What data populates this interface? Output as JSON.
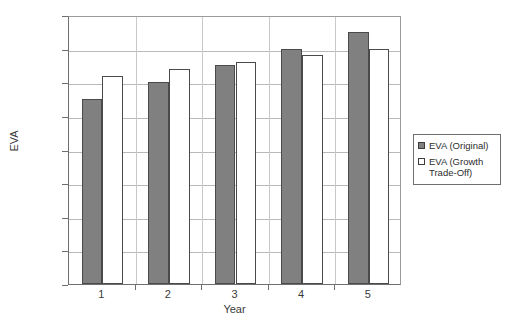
{
  "chart_data": {
    "type": "bar",
    "title": "",
    "xlabel": "Year",
    "ylabel": "EVA",
    "categories": [
      "1",
      "2",
      "3",
      "4",
      "5"
    ],
    "series": [
      {
        "name": "EVA (Original)",
        "values": [
          5.5,
          6.0,
          6.5,
          7.0,
          7.5
        ],
        "color": "#808080"
      },
      {
        "name": "EVA (Growth Trade-Off)",
        "values": [
          6.2,
          6.4,
          6.6,
          6.8,
          7.0
        ],
        "color": "#ffffff"
      }
    ],
    "ylim": [
      0,
      8
    ],
    "ytick_values": [
      0,
      1,
      2,
      3,
      4,
      5,
      6,
      7,
      8
    ],
    "ytick_labels": [
      "$-",
      "$1.00",
      "$2.00",
      "$3.00",
      "$4.00",
      "$5.00",
      "$6.00",
      "$7.00",
      "$8.00"
    ],
    "grid": true,
    "legend_position": "right"
  },
  "legend": {
    "entries": [
      {
        "label": "EVA (Original)"
      },
      {
        "label": "EVA (Growth Trade-Off)"
      }
    ]
  }
}
